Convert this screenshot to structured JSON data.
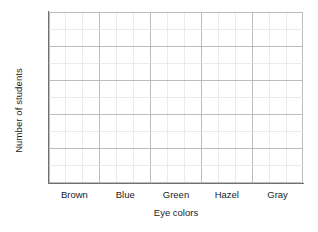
{
  "chart_data": {
    "type": "bar",
    "title": "",
    "subtitle": "",
    "xlabel": "Eye colors",
    "ylabel": "Number of students",
    "categories": [
      "Brown",
      "Blue",
      "Green",
      "Hazel",
      "Gray"
    ],
    "values": [
      null,
      null,
      null,
      null,
      null
    ],
    "series": [
      {
        "name": "Number of students",
        "values": [
          null,
          null,
          null,
          null,
          null
        ]
      }
    ],
    "annotations": [],
    "legend": {
      "visible": false,
      "position": "none",
      "entries": []
    },
    "grid": {
      "visible": true,
      "columns": 15,
      "rows": 10,
      "major_column_every": 3,
      "major_row_every": 2,
      "major_color": "#b4b6ba",
      "minor_color": "#e2e3e6"
    },
    "axes": {
      "x": {
        "line_color": "#6f7072",
        "tick_labels": [
          "Brown",
          "Blue",
          "Green",
          "Hazel",
          "Gray"
        ],
        "tick_marks": false
      },
      "y": {
        "line_color": "#6f7072",
        "tick_labels": [],
        "tick_marks": false,
        "ylim": [
          0,
          10
        ]
      }
    },
    "blank_template": true,
    "plot_background": "#ffffff"
  },
  "page": {
    "background": "#ffffff",
    "text_color": "#1c1c1c"
  }
}
